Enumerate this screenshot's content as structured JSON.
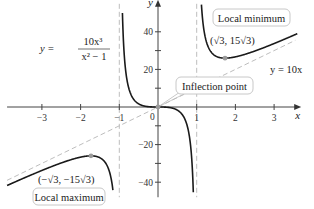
{
  "chart_data": {
    "type": "line",
    "title": "",
    "function_label": {
      "lhs": "y =",
      "numerator": "10x³",
      "denominator": "x² − 1"
    },
    "xlabel": "x",
    "ylabel": "y",
    "xlim": [
      -3.9,
      3.7
    ],
    "ylim": [
      -48,
      57
    ],
    "x_ticks": [
      -3,
      -2,
      -1,
      1,
      2,
      3
    ],
    "x_tick_labels": [
      "−3",
      "−2",
      "−1",
      "1",
      "2",
      "3"
    ],
    "origin_label": "0",
    "y_ticks": [
      -40,
      -30,
      -20,
      -10,
      10,
      20,
      30,
      40
    ],
    "y_tick_labels": [
      {
        "value": -40,
        "label": "−40"
      },
      {
        "value": -20,
        "label": "−20"
      },
      {
        "value": 20,
        "label": "20"
      },
      {
        "value": 40,
        "label": "40"
      }
    ],
    "grid": false,
    "series": [
      {
        "name": "y = 10x^3/(x^2 - 1)",
        "style": "solid",
        "color": "#1a1a1a",
        "function": "10*x^3/(x^2-1)"
      },
      {
        "name": "y = 10x",
        "style": "dashed",
        "color": "#b5b5b5",
        "function": "10*x",
        "label": "y = 10x"
      }
    ],
    "asymptotes": [
      {
        "type": "vertical",
        "x": -1,
        "style": "dashed",
        "color": "#b5b5b5"
      },
      {
        "type": "vertical",
        "x": 1,
        "style": "dashed",
        "color": "#b5b5b5"
      }
    ],
    "points": [
      {
        "name": "local-minimum",
        "x": 1.732,
        "y": 25.98,
        "coord_label": "(√3, 15√3)",
        "box_label": "Local minimum",
        "color": "#9a9a9a"
      },
      {
        "name": "local-maximum",
        "x": -1.732,
        "y": -25.98,
        "coord_label": "(−√3, −15√3)",
        "box_label": "Local maximum",
        "color": "#9a9a9a"
      },
      {
        "name": "inflection-point",
        "x": 0,
        "y": 0,
        "box_label": "Inflection point",
        "color": "#9a9a9a"
      }
    ]
  }
}
